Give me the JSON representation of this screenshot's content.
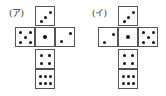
{
  "nets": [
    {
      "label": "(ア)",
      "faces": [
        {
          "pos": "top",
          "pips": 3,
          "orientation": "diag-up-right"
        },
        {
          "pos": "left",
          "pips": 5
        },
        {
          "pos": "center",
          "pips": 1
        },
        {
          "pos": "right",
          "pips": 2,
          "orientation": "diag-up-right"
        },
        {
          "pos": "below1",
          "pips": 4
        },
        {
          "pos": "below2",
          "pips": 6
        }
      ]
    },
    {
      "label": "(イ)",
      "faces": [
        {
          "pos": "top",
          "pips": 3,
          "orientation": "diag-up-right"
        },
        {
          "pos": "left",
          "pips": 2,
          "orientation": "diag-up-right"
        },
        {
          "pos": "center",
          "pips": 1
        },
        {
          "pos": "right",
          "pips": 5
        },
        {
          "pos": "below1",
          "pips": 4
        },
        {
          "pos": "below2",
          "pips": 6
        }
      ]
    }
  ]
}
